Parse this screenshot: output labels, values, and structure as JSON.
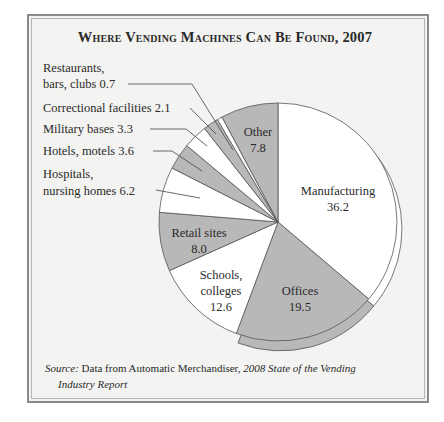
{
  "chart_data": {
    "type": "pie",
    "title": "Where Vending Machines Can Be Found, 2007",
    "unit": "percent",
    "categories": [
      "Manufacturing",
      "Offices",
      "Schools, colleges",
      "Retail sites",
      "Hospitals, nursing homes",
      "Hotels, motels",
      "Military bases",
      "Correctional facilities",
      "Restaurants, bars, clubs",
      "Other"
    ],
    "values": [
      36.2,
      19.5,
      12.6,
      8.0,
      6.2,
      3.6,
      3.3,
      2.1,
      0.7,
      7.8
    ],
    "fills": [
      "#ffffff",
      "#b8b8b8",
      "#ffffff",
      "#b8b8b8",
      "#ffffff",
      "#b8b8b8",
      "#ffffff",
      "#b8b8b8",
      "#ffffff",
      "#b8b8b8"
    ],
    "start_angle": "12 o'clock, clockwise",
    "legend": "none (direct labels)",
    "source": "Data from Automatic Merchandiser, 2008 State of the Vending Industry Report"
  },
  "title_text": "Where Vending Machines Can Be Found, 2007",
  "colors": {
    "gray_slice": "#b8b8b8",
    "white_slice": "#ffffff",
    "panel_bg": "#f3f3f1",
    "text": "#2a2a2a"
  },
  "labels": {
    "manufacturing": {
      "name": "Manufacturing",
      "value": "36.2"
    },
    "offices": {
      "name": "Offices",
      "value": "19.5"
    },
    "schools": {
      "line1": "Schools,",
      "line2": "colleges",
      "value": "12.6"
    },
    "retail": {
      "name": "Retail sites",
      "value": "8.0"
    },
    "other": {
      "name": "Other",
      "value": "7.8"
    },
    "restaurants": {
      "line1": "Restaurants,",
      "line2": "bars, clubs 0.7"
    },
    "correctional": {
      "line1": "Correctional facilities 2.1"
    },
    "military": {
      "line1": "Military bases 3.3"
    },
    "hotels": {
      "line1": "Hotels, motels 3.6"
    },
    "hospitals": {
      "line1": "Hospitals,",
      "line2": "nursing homes 6.2"
    }
  },
  "source": {
    "prefix": "Source:",
    "text": " Data from Automatic Merchandiser, ",
    "italic": "2008 State of the Vending",
    "line2": "Industry Report"
  },
  "geometry": {
    "back_manufacturing": "M283,110 L283,110 A119,119 0 0 1 373.7,306 L283,229 Z",
    "back_offices": "M283,229 L373.7,306 A119,119 0 0 1 238,343 Z",
    "slices": [
      "M278,222 L278,103 A119,119 0 0 1 368.7,299.0 Z",
      "M278,222 L368.7,299.0 A119,119 0 0 1 236.3,333.5 Z",
      "M278,222 L236.3,333.5 A119,119 0 0 1 169.4,270.6 Z",
      "M278,222 L169.4,270.6 A119,119 0 0 1 159.4,212.3 Z",
      "M278,222 L159.4,212.3 A119,119 0 0 1 172.0,168.0 Z",
      "M278,222 L172.0,168.0 A119,119 0 0 1 186.8,145.6 Z",
      "M278,222 L186.8,145.6 A119,119 0 0 1 204.5,128.4 Z",
      "M278,222 L204.5,128.4 A119,119 0 0 1 217.4,119.6 Z",
      "M278,222 L217.4,119.6 A119,119 0 0 1 222.0,117.0 Z",
      "M278,222 L222.0,117.0 A119,119 0 0 1 278,103 Z"
    ],
    "leaders": {
      "restaurants": "M128,84 L192,84 L233,150",
      "correctional": "M190,108 L216,134",
      "military": "M150,129 L186,129 L207,146",
      "hotels": "M153,151 L172,151 L202,171",
      "hospitals": "M156,190 L200,198"
    }
  }
}
